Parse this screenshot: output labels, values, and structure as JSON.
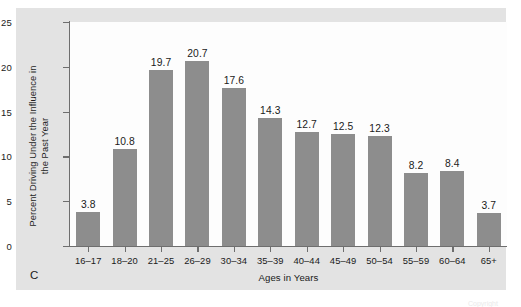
{
  "figure": {
    "panel_letter": "C",
    "background_color": "#e3e3e3",
    "plot_background_color": "#fdfdfd",
    "bar_color": "#8d8d8d",
    "axis_color": "#6e6e6e",
    "artifact_text": "Copyright"
  },
  "chart_data": {
    "type": "bar",
    "title": "",
    "subtitle": "",
    "xlabel": "Ages in Years",
    "ylabel": "Percent Driving Under the Influence in the Past Year",
    "ylabel_lines": [
      "Percent Driving Under the Influence in",
      "the Past Year"
    ],
    "categories": [
      "16–17",
      "18–20",
      "21–25",
      "26–29",
      "30–34",
      "35–39",
      "40–44",
      "45–49",
      "50–54",
      "55–59",
      "60–64",
      "65+"
    ],
    "values": [
      3.8,
      10.8,
      19.7,
      20.7,
      17.6,
      14.3,
      12.7,
      12.5,
      12.3,
      8.2,
      8.4,
      3.7
    ],
    "value_labels": [
      "3.8",
      "10.8",
      "19.7",
      "20.7",
      "17.6",
      "14.3",
      "12.7",
      "12.5",
      "12.3",
      "8.2",
      "8.4",
      "3.7"
    ],
    "ylim": [
      0,
      25
    ],
    "yticks": [
      0,
      5,
      10,
      15,
      20,
      25
    ],
    "ytick_labels": [
      "0",
      "5",
      "10",
      "15",
      "20",
      "25"
    ],
    "grid": false,
    "legend": false,
    "legend_position": "none"
  }
}
